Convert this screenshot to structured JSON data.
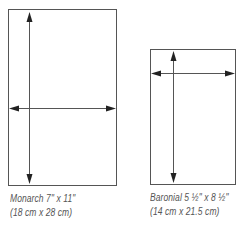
{
  "envelopes": [
    {
      "name": "Monarch",
      "caption_line1": "Monarch 7\" x 11\"",
      "caption_line2": "(18 cm x 28 cm)",
      "width_in": "7\"",
      "height_in": "11\"",
      "width_cm": "18 cm",
      "height_cm": "28 cm"
    },
    {
      "name": "Baronial",
      "caption_line1": "Baronial 5 ½\" x 8 ½\"",
      "caption_line2": "(14 cm x 21.5 cm)",
      "width_in": "5 ½\"",
      "height_in": "8 ½\"",
      "width_cm": "14 cm",
      "height_cm": "21.5 cm"
    }
  ],
  "colors": {
    "line": "#555555",
    "arrow": "#222222",
    "text": "#555555"
  }
}
